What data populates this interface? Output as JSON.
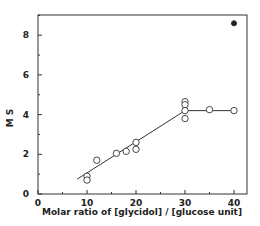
{
  "chart_data": {
    "type": "scatter",
    "title": "",
    "xlabel": "Molar ratio of [glycidol] / [glucose unit]",
    "ylabel": "M S",
    "xlim": [
      0,
      42
    ],
    "ylim": [
      0,
      9
    ],
    "x_ticks": [
      0,
      10,
      20,
      30,
      40
    ],
    "y_ticks": [
      0,
      2,
      4,
      6,
      8
    ],
    "grid": false,
    "legend": null,
    "series": [
      {
        "name": "open circles",
        "marker": "open-circle",
        "points": [
          {
            "x": 10,
            "y": 0.9
          },
          {
            "x": 10,
            "y": 0.7
          },
          {
            "x": 12,
            "y": 1.7
          },
          {
            "x": 16,
            "y": 2.05
          },
          {
            "x": 18,
            "y": 2.15
          },
          {
            "x": 20,
            "y": 2.6
          },
          {
            "x": 20,
            "y": 2.25
          },
          {
            "x": 30,
            "y": 4.65
          },
          {
            "x": 30,
            "y": 4.5
          },
          {
            "x": 30,
            "y": 4.2
          },
          {
            "x": 30,
            "y": 3.8
          },
          {
            "x": 35,
            "y": 4.25
          },
          {
            "x": 40,
            "y": 4.2
          }
        ]
      },
      {
        "name": "filled circle",
        "marker": "filled-circle",
        "points": [
          {
            "x": 40,
            "y": 8.6
          }
        ]
      },
      {
        "name": "trend line",
        "marker": "line",
        "points": [
          {
            "x": 8,
            "y": 0.75
          },
          {
            "x": 30,
            "y": 4.2
          },
          {
            "x": 40,
            "y": 4.2
          }
        ]
      }
    ]
  },
  "labels": {
    "xlabel": "Molar ratio of [glycidol] / [glucose unit]",
    "ylabel": "M S",
    "x_ticks": [
      "0",
      "10",
      "20",
      "30",
      "40"
    ],
    "y_ticks": [
      "0",
      "2",
      "4",
      "6",
      "8"
    ]
  }
}
